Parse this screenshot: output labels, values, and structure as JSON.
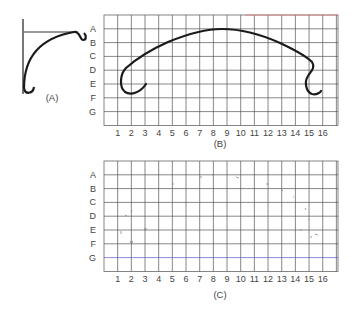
{
  "figure_a": {
    "caption": "(A)"
  },
  "figure_b": {
    "caption": "(B)",
    "row_labels": [
      "A",
      "B",
      "C",
      "D",
      "E",
      "F",
      "G"
    ],
    "col_labels": [
      "1",
      "2",
      "3",
      "4",
      "5",
      "6",
      "7",
      "8",
      "9",
      "10",
      "11",
      "12",
      "13",
      "14",
      "15",
      "16"
    ]
  },
  "figure_c": {
    "caption": "(C)",
    "row_labels": [
      "A",
      "B",
      "C",
      "D",
      "E",
      "F",
      "G"
    ],
    "col_labels": [
      "1",
      "2",
      "3",
      "4",
      "5",
      "6",
      "7",
      "8",
      "9",
      "10",
      "11",
      "12",
      "13",
      "14",
      "15",
      "16"
    ]
  },
  "colors": {
    "grid_line": "#555555",
    "curve": "#1a1a1a",
    "label_text": "#444444",
    "accent_top_red": "#e07a7a",
    "accent_bottom_blue": "#5a5ad0"
  }
}
